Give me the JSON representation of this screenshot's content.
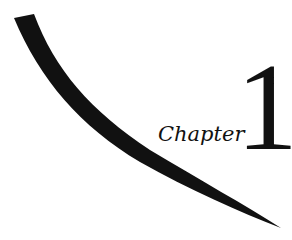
{
  "chapter": {
    "label": "Chapter",
    "number": "1"
  },
  "colors": {
    "ink": "#111111",
    "background": "#ffffff"
  }
}
